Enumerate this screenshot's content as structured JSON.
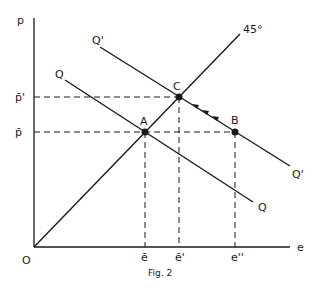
{
  "figure": {
    "caption": "Fig. 2",
    "axes": {
      "y_label": "p",
      "x_label": "e",
      "origin_label": "O"
    },
    "y_ticks": [
      {
        "label": "p̄'",
        "y": 97
      },
      {
        "label": "p̄",
        "y": 132
      }
    ],
    "x_ticks": [
      {
        "label": "ē",
        "x": 145
      },
      {
        "label": "ē'",
        "x": 179
      },
      {
        "label": "e''",
        "x": 235
      }
    ],
    "lines": {
      "diagonal_label": "45°",
      "q_label_start": "Q",
      "q_label_end": "Q",
      "q_prime_label_start": "Q'",
      "q_prime_label_end": "Q'"
    },
    "points": {
      "a": "A",
      "b": "B",
      "c": "C"
    },
    "colors": {
      "ink": "#1a1a1a",
      "background": "#ffffff"
    }
  }
}
